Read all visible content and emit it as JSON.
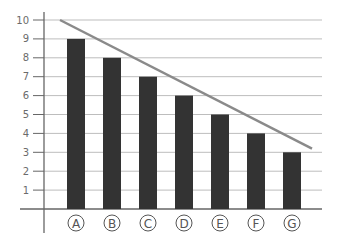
{
  "chart_data": {
    "type": "bar",
    "title": "",
    "xlabel": "",
    "ylabel": "",
    "categories": [
      "A",
      "B",
      "C",
      "D",
      "E",
      "F",
      "G"
    ],
    "values": [
      9,
      8,
      7,
      6,
      5,
      4,
      3
    ],
    "ylim": [
      0,
      10
    ],
    "yticks": [
      1,
      2,
      3,
      4,
      5,
      6,
      7,
      8,
      9,
      10
    ],
    "grid": true,
    "legend": null,
    "annotations": [
      {
        "type": "trend_line",
        "from": {
          "x": "left of A",
          "y": 10
        },
        "to": {
          "x": "right of G",
          "y": 3.2
        },
        "description": "descending straight line above bar tops"
      }
    ],
    "category_label_style": "circled letters"
  },
  "colors": {
    "bar": "#333333",
    "grid": "#bdbdbd",
    "axis": "#666666",
    "trend_line": "#8a8a8a",
    "tick_text": "#6b6b6b"
  }
}
